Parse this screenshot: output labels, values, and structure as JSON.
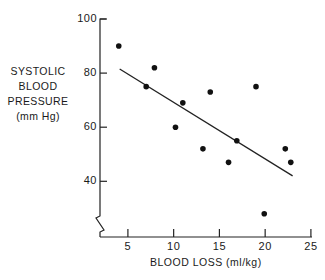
{
  "chart_data": {
    "type": "scatter",
    "title": "",
    "xlabel": "BLOOD LOSS (ml/kg)",
    "ylabel_lines": [
      "SYSTOLIC",
      "BLOOD",
      "PRESSURE",
      "(mm Hg)"
    ],
    "ylabel": "SYSTOLIC BLOOD PRESSURE (mm Hg)",
    "xlim": [
      0,
      25
    ],
    "ylim": [
      20,
      100
    ],
    "x_ticks": [
      5,
      10,
      15,
      20,
      25
    ],
    "y_ticks": [
      40,
      60,
      80,
      100
    ],
    "axis_break": "y-axis broken below 40",
    "grid": false,
    "legend": null,
    "series": [
      {
        "name": "observations",
        "points": [
          {
            "x": 4.0,
            "y": 90
          },
          {
            "x": 7.0,
            "y": 75
          },
          {
            "x": 7.9,
            "y": 82
          },
          {
            "x": 10.2,
            "y": 60
          },
          {
            "x": 11.0,
            "y": 69
          },
          {
            "x": 13.2,
            "y": 52
          },
          {
            "x": 14.0,
            "y": 73
          },
          {
            "x": 16.0,
            "y": 47
          },
          {
            "x": 16.9,
            "y": 55
          },
          {
            "x": 19.0,
            "y": 75
          },
          {
            "x": 19.9,
            "y": 28
          },
          {
            "x": 22.2,
            "y": 52
          },
          {
            "x": 22.8,
            "y": 47
          }
        ]
      }
    ],
    "regression_line": {
      "x1": 4.1,
      "y1": 81.5,
      "x2": 23.0,
      "y2": 42.0
    }
  },
  "labels": {
    "y_ticks": [
      "100",
      "80",
      "60",
      "40"
    ],
    "x_ticks": [
      "5",
      "10",
      "15",
      "20",
      "25"
    ],
    "ylabel_lines": [
      "SYSTOLIC",
      "BLOOD",
      "PRESSURE",
      "(mm Hg)"
    ],
    "xlabel": "BLOOD LOSS  (ml/kg)"
  }
}
